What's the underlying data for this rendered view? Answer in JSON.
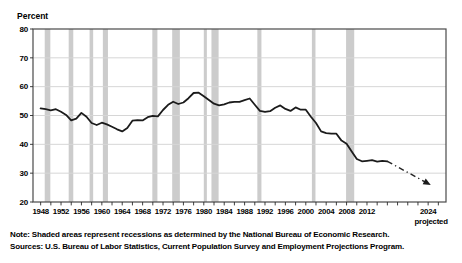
{
  "chart_data": {
    "type": "line",
    "title": "",
    "ylabel": "Percent",
    "xlabel": "",
    "ylim": [
      20,
      80
    ],
    "xlim": [
      1946.5,
      2027.5
    ],
    "yticks": [
      20,
      30,
      40,
      50,
      60,
      70,
      80
    ],
    "xticks": [
      1948,
      1952,
      1956,
      1960,
      1964,
      1968,
      1972,
      1976,
      1980,
      1984,
      1988,
      1992,
      1996,
      2000,
      2004,
      2008,
      2012
    ],
    "minor_tick_step_years": 2,
    "minor_tick_range": [
      1948,
      2026
    ],
    "grid": "horizontal",
    "legend_position": "none",
    "series": [
      {
        "name": "Historical",
        "style": "solid",
        "x_start": 1948,
        "x_step": 1,
        "values": [
          52.5,
          52.2,
          51.8,
          52.2,
          51.3,
          50.2,
          48.3,
          48.9,
          50.9,
          49.6,
          47.4,
          46.7,
          47.5,
          46.9,
          46.1,
          45.2,
          44.5,
          45.7,
          48.2,
          48.4,
          48.3,
          49.4,
          49.9,
          49.7,
          51.9,
          53.7,
          54.8,
          54.0,
          54.5,
          56.0,
          57.8,
          57.9,
          56.7,
          55.4,
          54.1,
          53.5,
          53.9,
          54.5,
          54.7,
          54.7,
          55.3,
          55.9,
          53.7,
          51.6,
          51.3,
          51.5,
          52.7,
          53.5,
          52.3,
          51.6,
          52.8,
          52.0,
          52.0,
          49.6,
          47.4,
          44.5,
          43.9,
          43.7,
          43.7,
          41.3,
          40.2,
          37.5,
          34.9,
          34.1,
          34.3,
          34.5,
          34.0,
          34.3,
          34.1
        ]
      },
      {
        "name": "Projected",
        "style": "dash-dot",
        "x": [
          2016,
          2024
        ],
        "values": [
          34.1,
          26.4
        ],
        "end_marker": "filled-triangle"
      }
    ],
    "recessions": [
      [
        1948.8,
        1949.9
      ],
      [
        1953.5,
        1954.4
      ],
      [
        1957.6,
        1958.3
      ],
      [
        1960.2,
        1961.2
      ],
      [
        1969.9,
        1970.9
      ],
      [
        1973.8,
        1975.3
      ],
      [
        1980.0,
        1980.6
      ],
      [
        1981.5,
        1982.9
      ],
      [
        1990.5,
        1991.3
      ],
      [
        2001.2,
        2001.9
      ],
      [
        2007.9,
        2009.5
      ]
    ],
    "projected_tick": {
      "label": "2024",
      "sublabel": "projected",
      "year": 2024
    }
  },
  "notes": {
    "note": "Note: Shaded areas represent recessions as determined by the National Bureau of Economic Research.",
    "sources": "Sources: U.S. Bureau of Labor Statistics, Current Population Survey and Employment Projections Program."
  },
  "colors": {
    "line": "#1b1b1b",
    "projection": "#222222",
    "recession_band": "#cccccc",
    "gridline": "#d6d6d6",
    "frame": "#4a4a4a",
    "tick": "#2a2a2a",
    "text": "#000000",
    "background": "#ffffff"
  }
}
